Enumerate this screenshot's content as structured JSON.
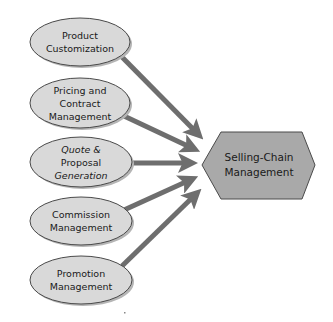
{
  "diagram": {
    "type": "hub-and-spoke",
    "colors": {
      "background": "#ffffff",
      "ellipse_fill": "#d9d9d9",
      "ellipse_stroke": "#4a4a4a",
      "ellipse_shadow": "#b5b5b5",
      "hub_fill": "#a9a9a9",
      "hub_stroke": "#4a4a4a",
      "arrow": "#6e6e6e",
      "text": "#1a1a1a"
    },
    "hub": {
      "label_line1": "Selling-Chain",
      "label_line2": "Management",
      "shape": "hexagon"
    },
    "nodes": [
      {
        "id": "product-customization",
        "line1": "Product",
        "line2": "Customization",
        "line3": ""
      },
      {
        "id": "pricing-contract",
        "line1": "Pricing and",
        "line2": "Contract",
        "line3": "Management"
      },
      {
        "id": "quote-proposal",
        "line1": "Quote &",
        "line2": "Proposal",
        "line3": "Generation"
      },
      {
        "id": "commission",
        "line1": "Commission",
        "line2": "Management",
        "line3": ""
      },
      {
        "id": "promotion",
        "line1": "Promotion",
        "line2": "Management",
        "line3": ""
      }
    ],
    "edges": [
      {
        "from": "product-customization",
        "to": "hub"
      },
      {
        "from": "pricing-contract",
        "to": "hub"
      },
      {
        "from": "quote-proposal",
        "to": "hub"
      },
      {
        "from": "commission",
        "to": "hub"
      },
      {
        "from": "promotion",
        "to": "hub"
      }
    ]
  }
}
